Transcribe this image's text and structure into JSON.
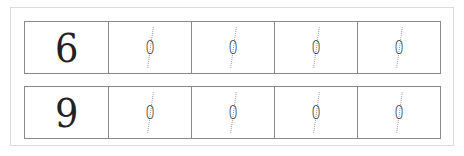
{
  "worksheet": {
    "rows": [
      {
        "lead_digit": "6",
        "trace_digits": [
          "0",
          "0",
          "0",
          "0"
        ]
      },
      {
        "lead_digit": "9",
        "trace_digits": [
          "0",
          "0",
          "0",
          "0"
        ]
      }
    ]
  },
  "colors": {
    "grid_line": "#8a8a8a",
    "frame_line": "#dcdcdc",
    "guide_dots": "#9a9a9a",
    "digit": "#222222"
  }
}
